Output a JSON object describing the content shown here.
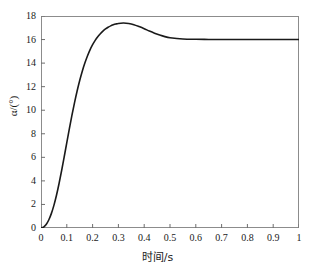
{
  "chart_data": {
    "type": "line",
    "title": "",
    "xlabel": "时间/s",
    "ylabel": "α/(°)",
    "xlim": [
      0,
      1
    ],
    "ylim": [
      0,
      18
    ],
    "grid": false,
    "legend": null,
    "xticks": [
      "0",
      "0.1",
      "0.2",
      "0.3",
      "0.4",
      "0.5",
      "0.6",
      "0.7",
      "0.8",
      "0.9",
      "1"
    ],
    "xtick_values": [
      0,
      0.1,
      0.2,
      0.3,
      0.4,
      0.5,
      0.6,
      0.7,
      0.8,
      0.9,
      1
    ],
    "yticks": [
      "0",
      "2",
      "4",
      "6",
      "8",
      "10",
      "12",
      "14",
      "16",
      "18"
    ],
    "ytick_values": [
      0,
      2,
      4,
      6,
      8,
      10,
      12,
      14,
      16,
      18
    ],
    "series": [
      {
        "name": "α",
        "color": "#1a1a1a",
        "x": [
          0.0,
          0.01,
          0.02,
          0.03,
          0.04,
          0.05,
          0.06,
          0.07,
          0.08,
          0.09,
          0.1,
          0.11,
          0.12,
          0.13,
          0.14,
          0.15,
          0.16,
          0.17,
          0.18,
          0.19,
          0.2,
          0.21,
          0.22,
          0.23,
          0.24,
          0.25,
          0.26,
          0.27,
          0.28,
          0.29,
          0.3,
          0.32,
          0.34,
          0.36,
          0.38,
          0.4,
          0.42,
          0.44,
          0.46,
          0.48,
          0.5,
          0.55,
          0.6,
          0.65,
          0.7,
          0.75,
          0.8,
          0.85,
          0.9,
          0.95,
          1.0
        ],
        "y": [
          0.0,
          0.08,
          0.3,
          0.68,
          1.22,
          1.92,
          2.78,
          3.78,
          4.88,
          6.05,
          7.25,
          8.44,
          9.58,
          10.65,
          11.63,
          12.52,
          13.31,
          14.0,
          14.6,
          15.12,
          15.56,
          15.93,
          16.24,
          16.5,
          16.72,
          16.9,
          17.04,
          17.16,
          17.25,
          17.32,
          17.37,
          17.4,
          17.36,
          17.26,
          17.1,
          16.92,
          16.72,
          16.54,
          16.38,
          16.25,
          16.16,
          16.05,
          16.02,
          16.01,
          16.0,
          16.0,
          16.0,
          16.0,
          16.0,
          16.0,
          16.0
        ]
      }
    ],
    "annotations": {
      "peak_value": 17.4,
      "peak_time": 0.31,
      "steady_state": 16.0,
      "initial_value": 0.0
    }
  }
}
